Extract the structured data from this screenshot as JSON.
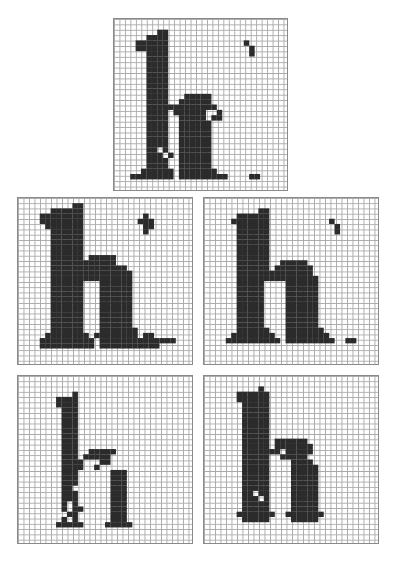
{
  "figure": {
    "grid_cols": 32,
    "grid_rows": 32,
    "ink_color": "#2b2b2b",
    "grid_line_color": "#a9a9a9",
    "background_color": "#ffffff"
  },
  "panels": [
    {
      "name": "glyph-h-top",
      "letter": "h",
      "box": {
        "x": 113,
        "y": 18,
        "w": 175,
        "h": 173
      },
      "rows": [
        "................................",
        "................................",
        "........##......................",
        "......####......................",
        "....######..............#.......",
        "....######...............#......",
        "......####...............#......",
        "......####......................",
        "......####......................",
        "......####......................",
        "......####......................",
        "......####......................",
        "......####......................",
        "......####......................",
        "......####...#####...............",
        "......####..######...............",
        "......#############.............",
        "......####.######..#.............",
        "......####..#####.##............",
        "......####..######..............",
        "......####..######..............",
        "......####..######..............",
        "......####..######..............",
        "......####..######..............",
        "......##.#..######..............",
        "......###.#.######..............",
        "......####..######..............",
        "......####..######..............",
        ".....######.#######.............",
        "...########.#########....##.....",
        "................................",
        "................................"
      ]
    },
    {
      "name": "glyph-h-middle-left",
      "letter": "h",
      "box": {
        "x": 17,
        "y": 197,
        "w": 176,
        "h": 168
      },
      "rows": [
        "................................",
        "..........##....................",
        "......######....................",
        "....########...........#........",
        "....########..........###.......",
        ".....#######...........##.......",
        "......######...........#........",
        "......######....................",
        "......######....................",
        "......######....................",
        "......######....................",
        "......######.#####..............",
        "......############..............",
        "......##############............",
        "......###############...........",
        "......###############...........",
        "......######...######...........",
        "......######...######...........",
        "......######...######...........",
        "......######...######...........",
        "......######...######...........",
        "......######...######...........",
        "......######...######...........",
        "......######...######...........",
        "......######...######...........",
        "......######...#######...........",
        ".....########.########.##.......",
        "....##########.##############...",
        "....##########.###########......",
        "................................",
        "................................",
        "................................"
      ]
    },
    {
      "name": "glyph-h-middle-right",
      "letter": "h",
      "box": {
        "x": 203,
        "y": 197,
        "w": 176,
        "h": 168
      },
      "rows": [
        "................................",
        "................................",
        "..........##....................",
        "......######....................",
        ".....#######...........#........",
        "......######............#.......",
        "......######............#.......",
        "......######....................",
        "......######....................",
        "......######....................",
        "......######....................",
        "......######....................",
        "......######..#####.............",
        "......######.#######............",
        "......##############............",
        "......###############...........",
        "......#####....######...........",
        "......#####....######...........",
        "......#####....######...........",
        "......#####....######...........",
        "......#####....######...........",
        "......#####....######...........",
        "......#####....######...........",
        "......#####....######...........",
        "......#####....######...........",
        "......######...#######..........",
        ".....########..########.........",
        "....##########.#########..##....",
        "................................",
        "................................",
        "................................",
        "................................"
      ]
    },
    {
      "name": "glyph-h-bottom-left",
      "letter": "h",
      "box": {
        "x": 17,
        "y": 375,
        "w": 176,
        "h": 169
      },
      "rows": [
        "................................",
        "................................",
        "................................",
        "..........#.....................",
        ".......####.....................",
        ".......####.....................",
        "........###.....................",
        "........###.....................",
        "........###.....................",
        "........###.....................",
        "........###.....................",
        "........###.....................",
        "........###.....................",
        "........###.....................",
        "........###..#####..............",
        "........###.#####...............",
        "........####...##...............",
        "........####..#.................",
        "........###......###............",
        "........###......###............",
        "........###......###............",
        "........##.......###............",
        "........###......###............",
        "........###......###............",
        "........#.#......###............",
        "........#.##.....###............",
        ".........##......###............",
        "........#.#......###............",
        ".......#####....#####...........",
        "................................",
        "................................",
        "................................"
      ]
    },
    {
      "name": "glyph-h-bottom-right",
      "letter": "h",
      "box": {
        "x": 203,
        "y": 375,
        "w": 176,
        "h": 169
      },
      "rows": [
        "................................",
        "................................",
        "..........#.....................",
        "......######....................",
        "......######....................",
        ".......#####....................",
        ".......#####....................",
        ".......#####....................",
        ".......#####....................",
        ".......#####....................",
        ".......#####....................",
        ".......#####....................",
        ".......#####.######.............",
        ".......#####.#######............",
        ".......#######.#####............",
        ".......#####..#####.............",
        ".......#####....####............",
        ".......#####....#####...........",
        ".......#####....#####...........",
        ".......#####....#####...........",
        ".......#####....#####...........",
        ".......#####....#####...........",
        ".......##.##....#####...........",
        ".......###.#....#####...........",
        ".......#####....#####...........",
        ".......#####....#####...........",
        "......#######..#######..........",
        ".......#####....#####...........",
        "................................",
        "................................",
        "................................",
        "................................"
      ]
    }
  ]
}
